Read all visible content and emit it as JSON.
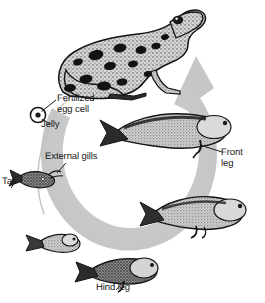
{
  "figure": {
    "background_color": "#ffffff",
    "arrow_color": "#cccccc",
    "ink_color": "#1a1a1a",
    "direction": "clockwise"
  },
  "labels": {
    "fertilized_egg": "Fertilized\negg cell",
    "jelly": "Jelly",
    "external_gills": "External gills",
    "tail": "Tail",
    "front_leg": "Front\nleg",
    "hind_leg": "Hind leg"
  },
  "stages": [
    {
      "name": "adult-frog",
      "label": "Adult frog",
      "order": 1,
      "position": "top-center"
    },
    {
      "name": "fertilized-egg",
      "label": "Fertilized egg cell in jelly",
      "order": 2,
      "position": "upper-left"
    },
    {
      "name": "hatchling-external-gills",
      "label": "Hatchling with external gills and tail",
      "order": 3,
      "position": "left"
    },
    {
      "name": "young-tadpole",
      "label": "Young tadpole",
      "order": 4,
      "position": "lower-left"
    },
    {
      "name": "tadpole-hind-legs",
      "label": "Tadpole with hind legs",
      "order": 5,
      "position": "bottom-center"
    },
    {
      "name": "tadpole-hind-legs-developed",
      "label": "Tadpole with developed hind legs",
      "order": 6,
      "position": "lower-right"
    },
    {
      "name": "tadpole-front-legs",
      "label": "Tadpole with front legs",
      "order": 7,
      "position": "upper-right"
    }
  ]
}
